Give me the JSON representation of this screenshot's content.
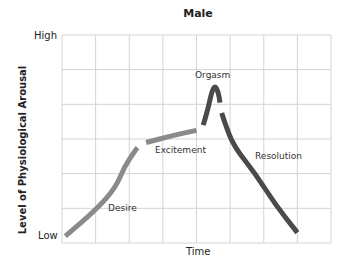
{
  "chart_data": {
    "type": "line",
    "title": "Male",
    "xlabel": "Time",
    "ylabel": "Level of Physiological Arousal",
    "y_tick_labels": [
      "Low",
      "High"
    ],
    "grid": true,
    "grid_columns": 8,
    "grid_rows": 6,
    "xlim": [
      0,
      8
    ],
    "ylim": [
      0,
      6
    ],
    "annotations": [
      "Desire",
      "Excitement",
      "Orgasm",
      "Resolution"
    ],
    "series": [
      {
        "name": "Desire",
        "color": "#8a8a8a",
        "points": [
          [
            0.1,
            0.2
          ],
          [
            1.0,
            0.95
          ],
          [
            1.6,
            1.6
          ],
          [
            1.85,
            2.2
          ],
          [
            2.2,
            2.7
          ],
          [
            2.25,
            2.75
          ]
        ]
      },
      {
        "name": "Excitement",
        "color": "#8a8a8a",
        "points": [
          [
            2.5,
            2.9
          ],
          [
            3.3,
            3.1
          ],
          [
            4.0,
            3.25
          ]
        ]
      },
      {
        "name": "Orgasm",
        "color": "#4a4a4a",
        "points": [
          [
            4.2,
            3.4
          ],
          [
            4.35,
            3.9
          ],
          [
            4.45,
            4.35
          ],
          [
            4.55,
            4.55
          ],
          [
            4.65,
            4.35
          ],
          [
            4.7,
            4.05
          ]
        ]
      },
      {
        "name": "Resolution",
        "color": "#4a4a4a",
        "points": [
          [
            4.75,
            3.75
          ],
          [
            4.85,
            3.45
          ],
          [
            5.1,
            2.8
          ],
          [
            5.75,
            2.0
          ],
          [
            6.35,
            1.1
          ],
          [
            7.0,
            0.3
          ]
        ]
      }
    ]
  },
  "labels": {
    "title": "Male",
    "ylabel": "Level of Physiological Arousal",
    "high": "High",
    "low": "Low",
    "xlabel": "Time",
    "desire": "Desire",
    "excitement": "Excitement",
    "orgasm": "Orgasm",
    "resolution": "Resolution"
  }
}
